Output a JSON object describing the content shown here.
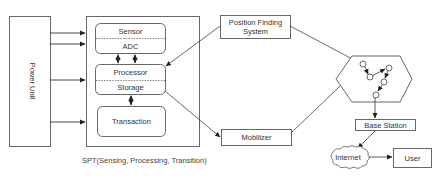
{
  "diagram": {
    "power_unit": {
      "label": "Power Unit"
    },
    "spt": {
      "caption": "SPT(Sensing, Processing, Transition)",
      "sensor_block": {
        "top": "Sensor",
        "bottom": "ADC"
      },
      "processor_block": {
        "top": "Processor",
        "bottom": "Storage"
      },
      "transaction_block": {
        "label": "Transaction"
      }
    },
    "position_finding": {
      "line1": "Position Finding",
      "line2": "System"
    },
    "mobilizer": {
      "label": "Mobilizer"
    },
    "sensor_field": {
      "shape": "hexagon",
      "node_count": 5
    },
    "base_station": {
      "label": "Base Station"
    },
    "internet": {
      "label": "Internet"
    },
    "user": {
      "label": "User"
    },
    "connections": [
      {
        "from": "Power Unit",
        "to": "Sensor",
        "directed": true
      },
      {
        "from": "Power Unit",
        "to": "ADC",
        "directed": true
      },
      {
        "from": "Power Unit",
        "to": "Processor",
        "directed": true
      },
      {
        "from": "Power Unit",
        "to": "Transaction",
        "directed": true
      },
      {
        "from": "ADC",
        "to": "Processor",
        "bidirectional": true
      },
      {
        "from": "ADC",
        "to": "Processor",
        "bidirectional": true
      },
      {
        "from": "Storage",
        "to": "Transaction",
        "bidirectional": true
      },
      {
        "from": "Position Finding System",
        "to": "Processor",
        "directed": true
      },
      {
        "from": "Storage",
        "to": "Mobilizer",
        "directed": true
      },
      {
        "from": "Position Finding System",
        "to": "Sensor Field",
        "directed": true
      },
      {
        "from": "Mobilizer",
        "to": "Sensor Field",
        "directed": true
      },
      {
        "from": "Sensor Field",
        "to": "Base Station",
        "directed": true
      },
      {
        "from": "Base Station",
        "to": "Internet",
        "directed": true
      },
      {
        "from": "Internet",
        "to": "User",
        "directed": true
      }
    ],
    "colors": {
      "stroke": "#555555",
      "text": "#333333",
      "background": "#ffffff"
    }
  }
}
